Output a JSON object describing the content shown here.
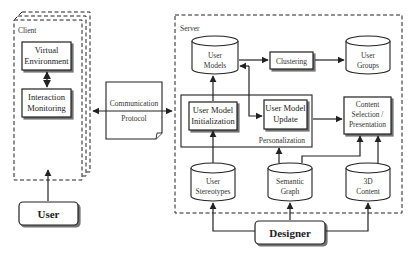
{
  "containers": {
    "client": "Client",
    "server": "Server",
    "personalization": "Personalization"
  },
  "nodes": {
    "virtual_environment": [
      "Virtual",
      "Environment"
    ],
    "interaction_monitoring": [
      "Interaction",
      "Monitoring"
    ],
    "user": "User",
    "communication_protocol": [
      "Communication",
      "Protocol"
    ],
    "user_models": [
      "User",
      "Models"
    ],
    "clustering": "Clustering",
    "user_groups": [
      "User",
      "Groups"
    ],
    "user_model_initialization": [
      "User Model",
      "Initialization"
    ],
    "user_model_update": [
      "User Model",
      "Update"
    ],
    "content_selection": [
      "Content",
      "Selection /",
      "Presentation"
    ],
    "user_stereotypes": [
      "User",
      "Stereotypes"
    ],
    "semantic_graph": [
      "Semantic",
      "Graph"
    ],
    "content_3d": [
      "3D",
      "Content"
    ],
    "designer": "Designer"
  }
}
